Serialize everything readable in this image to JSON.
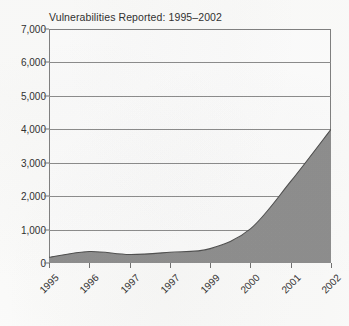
{
  "chart_data": {
    "type": "area",
    "title": "Vulnerabilities Reported: 1995–2002",
    "xlabel": "",
    "ylabel": "",
    "categories": [
      "1995",
      "1996",
      "1997",
      "1997",
      "1999",
      "2000",
      "2001",
      "2002"
    ],
    "values": [
      170,
      345,
      255,
      320,
      430,
      1020,
      2440,
      4000
    ],
    "ylim": [
      0,
      7000
    ],
    "yticks": [
      0,
      1000,
      2000,
      3000,
      4000,
      5000,
      6000,
      7000
    ],
    "ytick_labels": [
      "0",
      "1,000",
      "2,000",
      "3,000",
      "4,000",
      "5,000",
      "6,000",
      "7,000"
    ],
    "grid": true,
    "legend": false,
    "series": [
      {
        "name": "Vulnerabilities Reported",
        "values": [
          170,
          345,
          255,
          320,
          430,
          1020,
          2440,
          4000
        ]
      }
    ],
    "colors": {
      "area_fill": "#8c8c8c",
      "area_line": "#4a4a4a",
      "gridline": "#8a8a8a",
      "frame": "#7e7e7e",
      "text": "#2b2b2b",
      "background": "#fdfdfc"
    }
  }
}
